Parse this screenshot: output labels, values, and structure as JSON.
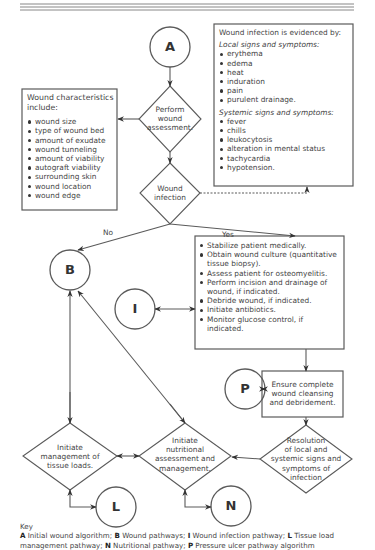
{
  "diagram": {
    "type": "clinical-flowchart",
    "nodes": {
      "A": {
        "label": "A"
      },
      "B": {
        "label": "B"
      },
      "I": {
        "label": "I"
      },
      "P": {
        "label": "P"
      },
      "L": {
        "label": "L"
      },
      "N": {
        "label": "N"
      },
      "perform_assessment": {
        "lines": [
          "Perform",
          "wound",
          "assessment."
        ]
      },
      "wound_infection": {
        "lines": [
          "Wound",
          "infection"
        ]
      },
      "initiate_tissue_loads": {
        "lines": [
          "Initiate",
          "management of",
          "tissue loads."
        ]
      },
      "initiate_nutritional": {
        "lines": [
          "Initiate",
          "nutritional",
          "assessment and",
          "management."
        ]
      },
      "resolution": {
        "lines": [
          "Resolution",
          "of local and",
          "systemic signs and",
          "symptoms of",
          "infection"
        ]
      },
      "ensure_cleansing": {
        "lines": [
          "Ensure complete",
          "wound cleansing",
          "and debridement."
        ]
      }
    },
    "wound_characteristics": {
      "title": "Wound characteristics include:",
      "items": [
        "wound size",
        "type of wound bed",
        "amount of exudate",
        "wound tunneling",
        "amount of viability",
        "autograft viability",
        "surrounding skin",
        "wound location",
        "wound edge"
      ]
    },
    "infection_evidence": {
      "title": "Wound infection is evidenced by:",
      "local_heading": "Local signs and symptoms:",
      "local_items": [
        "erythema",
        "edema",
        "heat",
        "induration",
        "pain",
        "purulent drainage."
      ],
      "systemic_heading": "Systemic signs and symptoms:",
      "systemic_items": [
        "fever",
        "chills",
        "leukocytosis",
        "alteration in mental status",
        "tachycardia",
        "hypotension."
      ]
    },
    "infection_actions": {
      "items": [
        "Stabilize patient medically.",
        "Obtain wound culture (quantitative tissue biopsy).",
        "Assess patient for osteomyelitis.",
        "Perform incision and drainage of wound, if indicated.",
        "Debride wound, if indicated.",
        "Initiate antibiotics.",
        "Monitor glucose control, if indicated."
      ]
    },
    "edge_labels": {
      "no": "No",
      "yes": "Yes"
    },
    "key": {
      "heading": "Key",
      "entries": [
        {
          "code": "A",
          "text": "Initial wound algorithm;"
        },
        {
          "code": "B",
          "text": "Wound pathways;"
        },
        {
          "code": "I",
          "text": "Wound infection pathway;"
        },
        {
          "code": "L",
          "text": "Tissue load management pathway;"
        },
        {
          "code": "N",
          "text": "Nutritional pathway;"
        },
        {
          "code": "P",
          "text": "Pressure ulcer pathway algorithm"
        }
      ]
    },
    "colors": {
      "stroke": "#5a5a5a",
      "text": "#444444",
      "background": "#ffffff"
    }
  }
}
